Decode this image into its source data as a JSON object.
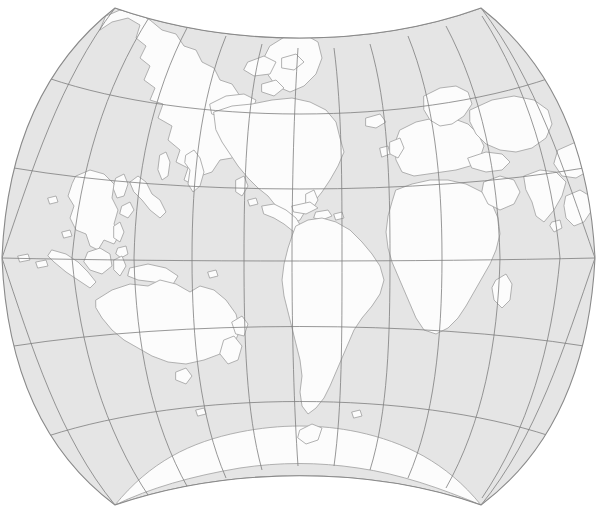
{
  "map": {
    "title": "World Map",
    "projection_name": "august-epicycloidal-conformal",
    "center_longitude": -160,
    "center_latitude": 0,
    "orientation": "pacific-centered",
    "colors": {
      "background": "#ffffff",
      "ocean": "#e5e5e5",
      "land": "#fcfcfc",
      "graticule": "#7e7e7e",
      "coastline": "#a8a8a8",
      "frame": "#8a8a8a"
    },
    "graticule": {
      "visible": true,
      "interval_degrees": 30,
      "parallels": [
        90,
        60,
        30,
        0,
        -30,
        -60,
        -90
      ],
      "meridians": [
        -180,
        -150,
        -120,
        -90,
        -60,
        -30,
        0,
        30,
        60,
        90,
        120,
        150,
        180
      ],
      "parallel_labels": [
        "90N",
        "60N",
        "30N",
        "0",
        "30S",
        "60S",
        "90S"
      ],
      "meridian_labels": [
        "180",
        "150W",
        "120W",
        "90W",
        "60W",
        "30W",
        "0",
        "30E",
        "60E",
        "90E",
        "120E",
        "150E",
        "180"
      ],
      "equator_y": 258,
      "prime_vertical_x": 299
    },
    "frame": {
      "shape": "lens",
      "top_center_y": 65,
      "bottom_center_y": 450,
      "left_edge_x": 2,
      "right_edge_x": 595,
      "corner_top_left": [
        115,
        8
      ],
      "corner_top_right": [
        481,
        8
      ],
      "corner_bottom_left": [
        115,
        505
      ],
      "corner_bottom_right": [
        481,
        505
      ]
    },
    "landmasses": [
      "Asia",
      "Japan",
      "Kamchatka",
      "Philippines",
      "Indonesia",
      "Papua New Guinea",
      "Australia",
      "New Zealand",
      "Antarctica",
      "Greenland",
      "North America",
      "Central America",
      "Caribbean",
      "South America",
      "Africa",
      "Madagascar",
      "Europe",
      "Iceland",
      "British Isles",
      "Arabia",
      "India",
      "Sri Lanka"
    ]
  }
}
